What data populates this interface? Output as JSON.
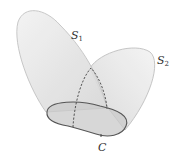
{
  "diagram": {
    "labels": {
      "s1_main": "S",
      "s1_sub": "1",
      "s2_main": "S",
      "s2_sub": "2",
      "c": "C"
    },
    "colors": {
      "surface_fill": "#e4e4e4",
      "surface_edge": "#b8b8b8",
      "base_fill": "#c8c8c8",
      "base_edge": "#555555",
      "dashed": "#444444",
      "text": "#333333"
    },
    "elements": [
      {
        "id": "S1",
        "type": "surface",
        "label": "S₁"
      },
      {
        "id": "S2",
        "type": "surface",
        "label": "S₂"
      },
      {
        "id": "C",
        "type": "boundary-curve",
        "label": "C"
      }
    ]
  }
}
